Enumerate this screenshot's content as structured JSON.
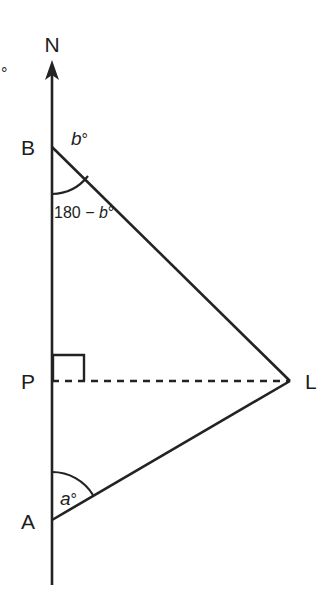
{
  "figure": {
    "type": "geometry-diagram",
    "background_color": "#ffffff",
    "line_color": "#232323"
  },
  "points": {
    "north": {
      "label": "N",
      "x": 52,
      "y": 61
    },
    "b": {
      "label": "B",
      "x": 52,
      "y": 147
    },
    "p": {
      "label": "P",
      "x": 52,
      "y": 381
    },
    "a": {
      "label": "A",
      "x": 52,
      "y": 520
    },
    "l": {
      "label": "L",
      "x": 290,
      "y": 381
    }
  },
  "labels": {
    "north": "N",
    "b_point": "B",
    "p_point": "P",
    "a_point": "A",
    "l_point": "L",
    "angle_b_exterior": "b",
    "angle_b_exterior_degree": "°",
    "angle_b_interior_prefix": "180 − ",
    "angle_b_interior_var": "b",
    "angle_b_interior_degree": "°",
    "angle_a": "a",
    "angle_a_degree": "°",
    "edge_fragment": "°"
  },
  "segments": {
    "north_line": {
      "name": "north-line",
      "from": [
        52,
        61
      ],
      "to": [
        52,
        585
      ],
      "style": "solid"
    },
    "bl": {
      "name": "segment-bl",
      "from": [
        52,
        147
      ],
      "to": [
        290,
        381
      ],
      "style": "solid"
    },
    "al": {
      "name": "segment-al",
      "from": [
        52,
        520
      ],
      "to": [
        290,
        381
      ],
      "style": "solid"
    },
    "pl": {
      "name": "segment-pl",
      "from": [
        52,
        381
      ],
      "to": [
        290,
        381
      ],
      "style": "dashed"
    }
  },
  "markers": {
    "right_angle": {
      "name": "right-angle-marker",
      "at": "P",
      "size": 31
    },
    "arc_b": {
      "name": "angle-arc-b",
      "at": "B",
      "radius": 47
    },
    "arc_a": {
      "name": "angle-arc-a",
      "at": "A",
      "radius": 48
    },
    "north_arrow": {
      "name": "north-arrowhead",
      "at": [
        52,
        61
      ]
    }
  }
}
